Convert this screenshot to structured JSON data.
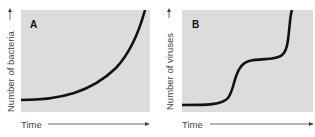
{
  "panels": [
    {
      "id": "A",
      "letter": "A",
      "ylabel": "Number of bacteria",
      "xlabel": "Time",
      "curve": "exponential growth"
    },
    {
      "id": "B",
      "letter": "B",
      "ylabel": "Number of viruses",
      "xlabel": "Time",
      "curve": "stepwise (two-step) growth"
    }
  ],
  "colors": {
    "plot_bg": "#dcdcdc",
    "curve": "#111111",
    "text": "#444444"
  }
}
